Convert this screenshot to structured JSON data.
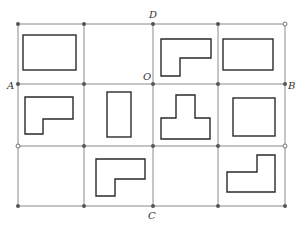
{
  "labels": {
    "A": "A",
    "B": "B",
    "C": "C",
    "D": "D",
    "O": "O"
  },
  "grid": {
    "columns": 4,
    "rows": 3,
    "x_lines": [
      18,
      84,
      153,
      218,
      285
    ],
    "y_lines": [
      24,
      84,
      146,
      206
    ]
  },
  "shapes": [
    {
      "cell": "r1c1",
      "type": "rectangle"
    },
    {
      "cell": "r1c2",
      "type": "empty"
    },
    {
      "cell": "r1c3",
      "type": "L-shape"
    },
    {
      "cell": "r1c4",
      "type": "rectangle"
    },
    {
      "cell": "r2c1",
      "type": "L-shape"
    },
    {
      "cell": "r2c2",
      "type": "tall-rectangle"
    },
    {
      "cell": "r2c3",
      "type": "T-shape"
    },
    {
      "cell": "r2c4",
      "type": "square"
    },
    {
      "cell": "r3c1",
      "type": "empty"
    },
    {
      "cell": "r3c2",
      "type": "L-shape"
    },
    {
      "cell": "r3c3",
      "type": "empty"
    },
    {
      "cell": "r3c4",
      "type": "L-shape"
    }
  ]
}
